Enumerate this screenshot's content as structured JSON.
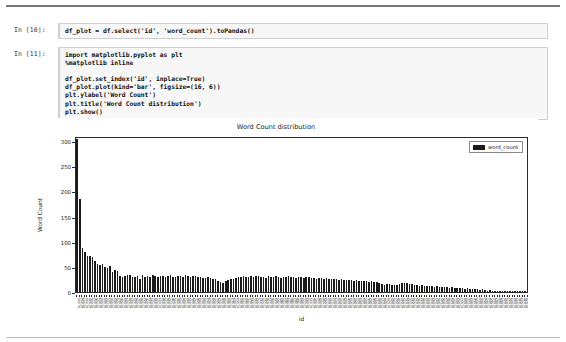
{
  "notebook": {
    "cells": [
      {
        "prompt": "In [10]:",
        "source": "df_plot = df.select('id', 'word_count').toPandas()"
      },
      {
        "prompt": "In [11]:",
        "source": "import matplotlib.pyplot as plt\n%matplotlib inline\n\ndf_plot.set_index('id', inplace=True)\ndf_plot.plot(kind='bar', figsize=(16, 6))\nplt.ylabel('Word Count')\nplt.title('Word Count distribution')\nplt.show()"
      }
    ]
  },
  "chart_data": {
    "type": "bar",
    "title": "Word Count distribution",
    "xlabel": "id",
    "ylabel": "Word Count",
    "ylim": [
      0,
      310
    ],
    "yticks": [
      0,
      50,
      100,
      150,
      200,
      250,
      300
    ],
    "grid": false,
    "legend": {
      "position": "upper right",
      "entries": [
        "word_count"
      ]
    },
    "series": [
      {
        "name": "word_count",
        "color": "#1a1a1a",
        "values": [
          305,
          185,
          88,
          80,
          72,
          72,
          70,
          62,
          55,
          54,
          55,
          50,
          48,
          52,
          40,
          44,
          42,
          32,
          30,
          32,
          33,
          34,
          30,
          30,
          32,
          26,
          34,
          30,
          32,
          30,
          33,
          31,
          30,
          32,
          31,
          29,
          31,
          33,
          30,
          29,
          31,
          32,
          30,
          33,
          31,
          30,
          32,
          31,
          29,
          30,
          28,
          27,
          30,
          28,
          26,
          25,
          22,
          19,
          17,
          22,
          24,
          26,
          25,
          27,
          29,
          30,
          31,
          30,
          29,
          31,
          30,
          32,
          31,
          29,
          30,
          28,
          31,
          30,
          29,
          31,
          30,
          28,
          30,
          29,
          31,
          30,
          29,
          28,
          30,
          29,
          28,
          30,
          29,
          27,
          28,
          26,
          27,
          28,
          26,
          27,
          26,
          25,
          26,
          25,
          24,
          25,
          24,
          23,
          24,
          23,
          22,
          23,
          22,
          21,
          22,
          21,
          20,
          21,
          20,
          19,
          18,
          16,
          14,
          15,
          16,
          14,
          13,
          14,
          16,
          17,
          18,
          17,
          16,
          15,
          14,
          13,
          12,
          13,
          12,
          11,
          12,
          11,
          10,
          11,
          10,
          9,
          10,
          9,
          8,
          9,
          8,
          7,
          8,
          7,
          6,
          7,
          6,
          5,
          6,
          5,
          4,
          5,
          4,
          3,
          4,
          3,
          3,
          2,
          3,
          2,
          2,
          2,
          2,
          1,
          2,
          1,
          1,
          1,
          1,
          1
        ]
      }
    ],
    "categories": [
      "id_001",
      "id_002",
      "id_003",
      "id_004",
      "id_005",
      "id_006",
      "id_007",
      "id_008",
      "id_009",
      "id_010",
      "id_011",
      "id_012",
      "id_013",
      "id_014",
      "id_015",
      "id_016",
      "id_017",
      "id_018",
      "id_019",
      "id_020",
      "id_021",
      "id_022",
      "id_023",
      "id_024",
      "id_025",
      "id_026",
      "id_027",
      "id_028",
      "id_029",
      "id_030",
      "id_031",
      "id_032",
      "id_033",
      "id_034",
      "id_035",
      "id_036",
      "id_037",
      "id_038",
      "id_039",
      "id_040",
      "id_041",
      "id_042",
      "id_043",
      "id_044",
      "id_045",
      "id_046",
      "id_047",
      "id_048",
      "id_049",
      "id_050",
      "id_051",
      "id_052",
      "id_053",
      "id_054",
      "id_055",
      "id_056",
      "id_057",
      "id_058",
      "id_059",
      "id_060",
      "id_061",
      "id_062",
      "id_063",
      "id_064",
      "id_065",
      "id_066",
      "id_067",
      "id_068",
      "id_069",
      "id_070",
      "id_071",
      "id_072",
      "id_073",
      "id_074",
      "id_075",
      "id_076",
      "id_077",
      "id_078",
      "id_079",
      "id_080",
      "id_081",
      "id_082",
      "id_083",
      "id_084",
      "id_085",
      "id_086",
      "id_087",
      "id_088",
      "id_089",
      "id_090",
      "id_091",
      "id_092",
      "id_093",
      "id_094",
      "id_095",
      "id_096",
      "id_097",
      "id_098",
      "id_099",
      "id_100",
      "id_101",
      "id_102",
      "id_103",
      "id_104",
      "id_105",
      "id_106",
      "id_107",
      "id_108",
      "id_109",
      "id_110",
      "id_111",
      "id_112",
      "id_113",
      "id_114",
      "id_115",
      "id_116",
      "id_117",
      "id_118",
      "id_119",
      "id_120",
      "id_121",
      "id_122",
      "id_123",
      "id_124",
      "id_125",
      "id_126",
      "id_127",
      "id_128",
      "id_129",
      "id_130",
      "id_131",
      "id_132",
      "id_133",
      "id_134",
      "id_135",
      "id_136",
      "id_137",
      "id_138",
      "id_139",
      "id_140",
      "id_141",
      "id_142",
      "id_143",
      "id_144",
      "id_145",
      "id_146",
      "id_147",
      "id_148",
      "id_149",
      "id_150",
      "id_151",
      "id_152",
      "id_153",
      "id_154",
      "id_155",
      "id_156",
      "id_157",
      "id_158",
      "id_159",
      "id_160",
      "id_161",
      "id_162",
      "id_163",
      "id_164",
      "id_165",
      "id_166",
      "id_167",
      "id_168",
      "id_169",
      "id_170",
      "id_171",
      "id_172",
      "id_173",
      "id_174",
      "id_175",
      "id_176",
      "id_177",
      "id_178",
      "id_179",
      "id_180"
    ]
  }
}
